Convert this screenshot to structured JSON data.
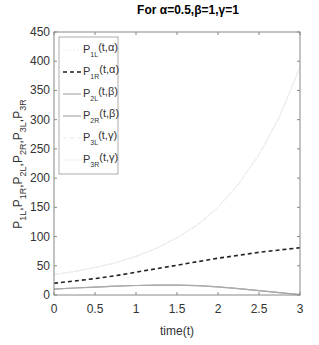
{
  "chart_data": {
    "type": "line",
    "title": "For α=0.5,β=1,γ=1",
    "xlabel": "time(t)",
    "ylabel": "P1L,P1R,P2L,P2R,P3L,P3R",
    "xlim": [
      0,
      3
    ],
    "ylim": [
      0,
      450
    ],
    "xticks": [
      0,
      0.5,
      1,
      1.5,
      2,
      2.5,
      3
    ],
    "xtick_labels": [
      "0",
      "0.5",
      "1",
      "1.5",
      "2",
      "2.5",
      "3"
    ],
    "yticks": [
      0,
      50,
      100,
      150,
      200,
      250,
      300,
      350,
      400,
      450
    ],
    "ytick_labels": [
      "0",
      "50",
      "100",
      "150",
      "200",
      "250",
      "300",
      "350",
      "400",
      "450"
    ],
    "grid": false,
    "legend_position": "upper-left",
    "x": [
      0,
      0.25,
      0.5,
      0.75,
      1,
      1.25,
      1.5,
      1.75,
      2,
      2.25,
      2.5,
      2.75,
      3
    ],
    "series": [
      {
        "name": "P1L(t,α)",
        "main": "P",
        "sub": "1L",
        "arg": "(t,α)",
        "style": "dotted",
        "color": "#e6e6e6",
        "width": 1,
        "values": [
          35,
          40,
          47,
          55,
          66,
          80,
          98,
          120,
          150,
          190,
          240,
          305,
          390
        ]
      },
      {
        "name": "P1R(t,α)",
        "main": "P",
        "sub": "1R",
        "arg": "(t,α)",
        "style": "dashed",
        "color": "#222222",
        "width": 1.6,
        "values": [
          20,
          24,
          28,
          33,
          39,
          45,
          51,
          57,
          63,
          68,
          73,
          77,
          81
        ]
      },
      {
        "name": "P2L(t,β)",
        "main": "P",
        "sub": "2L",
        "arg": "(t,β)",
        "style": "solid",
        "color": "#aaaaaa",
        "width": 1.2,
        "values": [
          10,
          12,
          13.5,
          15,
          16.3,
          17,
          17,
          16,
          14,
          11,
          7.5,
          4,
          0.5
        ]
      },
      {
        "name": "P2R(t,β)",
        "main": "P",
        "sub": "2R",
        "arg": "(t,β)",
        "style": "solid",
        "color": "#aaaaaa",
        "width": 1.2,
        "values": [
          10,
          12,
          13.5,
          15,
          16.3,
          17,
          17,
          16,
          14,
          11,
          7.5,
          4,
          0.5
        ]
      },
      {
        "name": "P3L(t,γ)",
        "main": "P",
        "sub": "3L",
        "arg": "(t,γ)",
        "style": "dashed",
        "color": "#e6e6e6",
        "width": 1,
        "values": [
          35,
          40,
          47,
          55,
          66,
          80,
          98,
          120,
          150,
          190,
          240,
          305,
          390
        ]
      },
      {
        "name": "P3R(t,γ)",
        "main": "P",
        "sub": "3R",
        "arg": "(t,γ)",
        "style": "solid",
        "color": "#eeeeee",
        "width": 1,
        "values": [
          35,
          40,
          47,
          55,
          66,
          80,
          98,
          120,
          150,
          190,
          240,
          305,
          390
        ]
      }
    ]
  },
  "colors": {
    "axis": "#888888",
    "text": "#333333",
    "background": "#ffffff"
  }
}
